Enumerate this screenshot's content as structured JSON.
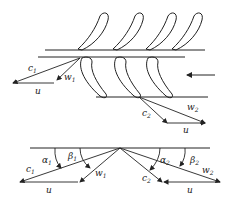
{
  "diagram": {
    "title": "",
    "stroke_color": "#222222",
    "background": "#ffffff",
    "upper_section": {
      "description": "Turbine blade cascade with inlet and outlet velocity triangles",
      "stator_blades_count": 4,
      "rotor_blades_count": 3,
      "flow_arrow": "left",
      "inlet_triangle": {
        "labels": {
          "c": "c",
          "c_sub": "1",
          "w": "w",
          "w_sub": "1",
          "u": "u"
        }
      },
      "outlet_triangle": {
        "labels": {
          "c": "c",
          "c_sub": "2",
          "w": "w",
          "w_sub": "2",
          "u": "u"
        }
      }
    },
    "lower_section": {
      "description": "Combined velocity triangles with flow angles",
      "left_triangle": {
        "labels": {
          "alpha": "α",
          "alpha_sub": "1",
          "beta": "β",
          "beta_sub": "1",
          "c": "c",
          "c_sub": "1",
          "w": "w",
          "w_sub": "1",
          "u": "u"
        }
      },
      "right_triangle": {
        "labels": {
          "alpha": "α",
          "alpha_sub": "2",
          "beta": "β",
          "beta_sub": "2",
          "c": "c",
          "c_sub": "2",
          "w": "w",
          "w_sub": "2",
          "u": "u"
        }
      }
    }
  }
}
